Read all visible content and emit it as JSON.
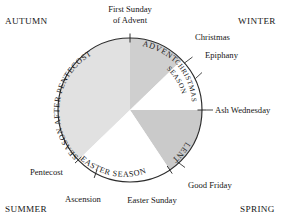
{
  "diagram": {
    "center": {
      "x": 130,
      "y": 110
    },
    "radius": 72,
    "outline_color": "#2b2b2b",
    "background_color": "#ffffff"
  },
  "seasons_corners": [
    {
      "key": "autumn",
      "label": "AUTUMN",
      "position": "top-left"
    },
    {
      "key": "winter",
      "label": "WINTER",
      "position": "top-right"
    },
    {
      "key": "spring",
      "label": "SPRING",
      "position": "bottom-right"
    },
    {
      "key": "summer",
      "label": "SUMMER",
      "position": "bottom-left"
    }
  ],
  "wedges": [
    {
      "key": "advent",
      "label": "ADVENT",
      "start_deg": 0,
      "end_deg": 46,
      "fill": "#cfcfcf"
    },
    {
      "key": "christmas-season",
      "label_line1": "CHRISTMAS",
      "label_line2": "SEASON",
      "start_deg": 46,
      "end_deg": 90,
      "fill": "#ffffff"
    },
    {
      "key": "lent",
      "label": "LENT",
      "start_deg": 90,
      "end_deg": 146,
      "fill": "#c9c9c9"
    },
    {
      "key": "easter-season",
      "label": "EASTER SEASON",
      "start_deg": 146,
      "end_deg": 226,
      "fill": "#ffffff"
    },
    {
      "key": "season-after-pentecost",
      "label": "SEASON AFTER PENTECOST",
      "start_deg": 226,
      "end_deg": 360,
      "fill": "#e0e0e0"
    }
  ],
  "events": [
    {
      "key": "first-sunday-of-advent",
      "line1": "First Sunday",
      "line2": "of Advent",
      "angle_deg": 0
    },
    {
      "key": "christmas",
      "label": "Christmas",
      "angle_deg": 34
    },
    {
      "key": "epiphany",
      "label": "Epiphany",
      "angle_deg": 52
    },
    {
      "key": "ash-wednesday",
      "label": "Ash Wednesday",
      "angle_deg": 90
    },
    {
      "key": "good-friday",
      "label": "Good Friday",
      "angle_deg": 140
    },
    {
      "key": "easter-sunday",
      "label": "Easter Sunday",
      "angle_deg": 152
    },
    {
      "key": "ascension",
      "label": "Ascension",
      "angle_deg": 208
    },
    {
      "key": "pentecost",
      "label": "Pentecost",
      "angle_deg": 226
    }
  ]
}
